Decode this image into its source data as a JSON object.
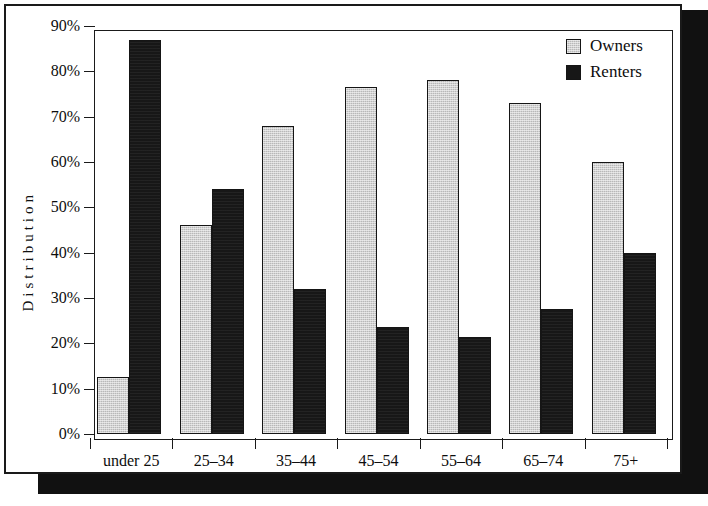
{
  "chart_data": {
    "type": "bar",
    "title": "",
    "xlabel": "",
    "ylabel": "Distribution",
    "ylim": [
      0,
      90
    ],
    "grid": false,
    "legend_position": "top-right",
    "categories": [
      "under 25",
      "25–34",
      "35–44",
      "45–54",
      "55–64",
      "65–74",
      "75+"
    ],
    "ytick_labels": [
      "0%",
      "10%",
      "20%",
      "30%",
      "40%",
      "50%",
      "60%",
      "70%",
      "80%",
      "90%"
    ],
    "ytick_values": [
      0,
      10,
      20,
      30,
      40,
      50,
      60,
      70,
      80,
      90
    ],
    "series": [
      {
        "name": "Owners",
        "color": "#b8b8b8",
        "values": [
          12.5,
          46,
          68,
          76.5,
          78,
          73,
          60
        ]
      },
      {
        "name": "Renters",
        "color": "#171717",
        "values": [
          87,
          54,
          32,
          23.5,
          21.5,
          27.5,
          40
        ]
      }
    ]
  },
  "legend": {
    "entries": [
      {
        "label": "Owners",
        "swatch": "light-gray-hatched-swatch"
      },
      {
        "label": "Renters",
        "swatch": "black-solid-swatch"
      }
    ]
  },
  "axes": {
    "y_title": "Distribution"
  }
}
